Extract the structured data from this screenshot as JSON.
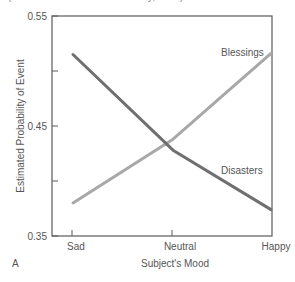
{
  "caption_top": "(Data from Johnson and Tversky, 1983)",
  "panel_label": "A",
  "colors": {
    "frame": "#555555",
    "disasters": "#6f6f6f",
    "blessings": "#a8a8a8",
    "text": "#555555"
  },
  "chart_data": {
    "type": "line",
    "title": "",
    "xlabel": "Subject's Mood",
    "ylabel": "Estimated Probability of Event",
    "categories": [
      "Sad",
      "Neutral",
      "Happy"
    ],
    "ylim": [
      0.35,
      0.55
    ],
    "yticks": [
      0.35,
      0.4,
      0.45,
      0.5,
      0.55
    ],
    "ytick_labels": [
      "0.35",
      "",
      "0.45",
      "",
      "0.55"
    ],
    "grid": false,
    "legend": "inline labels",
    "series": [
      {
        "name": "Disasters",
        "values": [
          0.515,
          0.428,
          0.374
        ]
      },
      {
        "name": "Blessings",
        "values": [
          0.38,
          0.438,
          0.516
        ]
      }
    ]
  }
}
